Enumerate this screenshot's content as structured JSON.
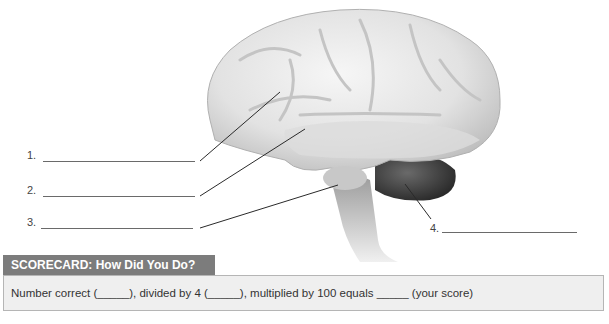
{
  "diagram": {
    "labels": [
      {
        "number": "1.",
        "answer": ""
      },
      {
        "number": "2.",
        "answer": ""
      },
      {
        "number": "3.",
        "answer": ""
      },
      {
        "number": "4.",
        "answer": ""
      }
    ]
  },
  "scorecard": {
    "title": "SCORECARD: How Did You Do?",
    "text": "Number correct (_____), divided by 4 (_____), multiplied by 100 equals _____ (your score)"
  },
  "colors": {
    "tab_bg": "#7c7c7c",
    "box_bg": "#efefef",
    "box_border": "#b5b5b5",
    "leader_line": "#2a2a2a"
  }
}
